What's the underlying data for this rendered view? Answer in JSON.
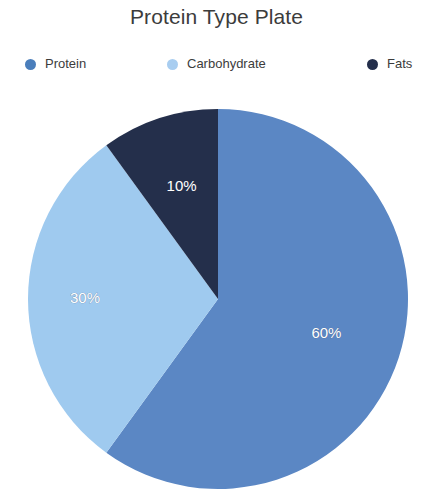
{
  "title": "Protein Type Plate",
  "legend": {
    "position": "top",
    "items": [
      {
        "label": "Protein",
        "color": "#4a7ebb",
        "swatch": "legend-dot-icon"
      },
      {
        "label": "Carbohydrate",
        "color": "#a8cdf0",
        "swatch": "legend-dot-icon"
      },
      {
        "label": "Fats",
        "color": "#242f4b",
        "swatch": "legend-dot-icon"
      }
    ]
  },
  "labels": {
    "protein": "60%",
    "carbohydrate": "30%",
    "fats": "10%"
  },
  "colors": {
    "protein": "#5b87c4",
    "carbohydrate": "#9fcaef",
    "fats": "#242f4b",
    "title_text": "#3c3c3c",
    "legend_text": "#3c3c3c",
    "slice_label_text": "#ffffff",
    "background": "#ffffff"
  },
  "chart_data": {
    "type": "pie",
    "title": "Protein Type Plate",
    "xlabel": "",
    "ylabel": "",
    "categories": [
      "Protein",
      "Carbohydrate",
      "Fats"
    ],
    "values": [
      60,
      30,
      10
    ],
    "unit": "%",
    "data_labels": [
      "60%",
      "30%",
      "10%"
    ],
    "colors": [
      "#5b87c4",
      "#9fcaef",
      "#242f4b"
    ],
    "start_angle_deg": 0,
    "direction": "clockwise",
    "legend_position": "top",
    "grid": false,
    "center_px": [
      218,
      299
    ],
    "radius_px": 190
  }
}
